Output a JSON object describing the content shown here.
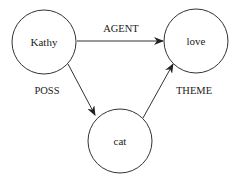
{
  "diagram": {
    "type": "semantic-network",
    "nodes": [
      {
        "id": "kathy",
        "label": "Kathy"
      },
      {
        "id": "love",
        "label": "love"
      },
      {
        "id": "cat",
        "label": "cat"
      }
    ],
    "edges": [
      {
        "from": "kathy",
        "to": "love",
        "label": "AGENT"
      },
      {
        "from": "kathy",
        "to": "cat",
        "label": "POSS"
      },
      {
        "from": "cat",
        "to": "love",
        "label": "THEME"
      }
    ]
  }
}
